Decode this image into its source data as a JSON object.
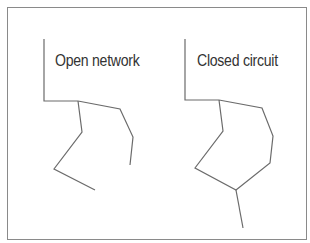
{
  "diagram": {
    "type": "comparison",
    "panels": [
      {
        "id": "open",
        "label": "Open network",
        "description": "Branching lines that do not reconnect",
        "paths": [
          "44,39 44,101 78,101",
          "78,101 82,132 54,169 95,190",
          "78,101 120,109 133,137 130,165"
        ]
      },
      {
        "id": "closed",
        "label": "Closed circuit",
        "description": "Lines forming a closed loop with a tail",
        "paths": [
          "185,39 185,100 219,100",
          "219,100 223,131 195,168 236,190 270,163 273,136 262,108 219,100",
          "236,190 243,228"
        ]
      }
    ]
  },
  "colors": {
    "stroke": "#6b6b6b",
    "frame": "#8a8a8a",
    "text": "#333333",
    "background": "#ffffff"
  }
}
